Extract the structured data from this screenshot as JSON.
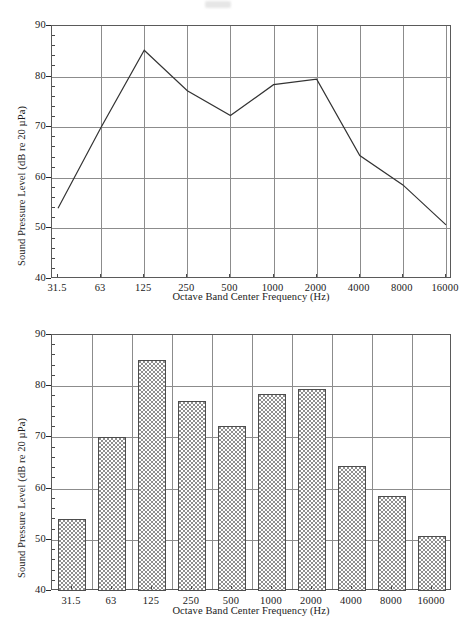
{
  "figure": {
    "axis_titles": {
      "x": "Octave Band Center Frequency (Hz)",
      "y": "Sound Pressure Level (dB re 20 µPa)"
    },
    "y_ticks": [
      "40",
      "50",
      "60",
      "70",
      "80",
      "90"
    ],
    "x_ticks": [
      "31.5",
      "63",
      "125",
      "250",
      "500",
      "1000",
      "2000",
      "4000",
      "8000",
      "16000"
    ],
    "colors": {
      "bar_fill": "#a0a0a0",
      "bar_edge": "#4d4d4d",
      "line": "#333333",
      "grid": "#8c8c8c",
      "axis": "#5a5a5a"
    }
  },
  "chart_data": [
    {
      "type": "line",
      "title": "",
      "xlabel": "Octave Band Center Frequency (Hz)",
      "ylabel": "Sound Pressure Level (dB re 20 µPa)",
      "categories": [
        "31.5",
        "63",
        "125",
        "250",
        "500",
        "1000",
        "2000",
        "4000",
        "8000",
        "16000"
      ],
      "values": [
        54.0,
        70.0,
        85.2,
        77.2,
        72.3,
        78.4,
        79.5,
        64.4,
        58.6,
        50.7
      ],
      "ylim": [
        40,
        90
      ],
      "ytick_step": 10,
      "yminor_step": 2,
      "grid": true,
      "legend": "none"
    },
    {
      "type": "bar",
      "title": "",
      "xlabel": "Octave Band Center Frequency (Hz)",
      "ylabel": "Sound Pressure Level (dB re 20 µPa)",
      "categories": [
        "31.5",
        "63",
        "125",
        "250",
        "500",
        "1000",
        "2000",
        "4000",
        "8000",
        "16000"
      ],
      "values": [
        54.0,
        70.0,
        85.2,
        77.2,
        72.3,
        78.4,
        79.5,
        64.4,
        58.6,
        50.7
      ],
      "ylim": [
        40,
        90
      ],
      "ytick_step": 10,
      "yminor_step": 2,
      "grid": true,
      "legend": "none"
    }
  ]
}
